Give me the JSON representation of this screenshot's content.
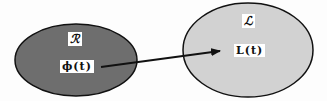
{
  "diagram": {
    "left_set": {
      "symbol": "ℛ",
      "element": "ϕ(t)",
      "fill": "#6e6e6e",
      "stroke": "#111111"
    },
    "right_set": {
      "symbol": "ℒ",
      "element": "L(t)",
      "fill": "#d2d2d2",
      "stroke": "#111111"
    },
    "arrow": {
      "from": "ϕ(t)",
      "to": "L(t)",
      "color": "#111111"
    }
  }
}
